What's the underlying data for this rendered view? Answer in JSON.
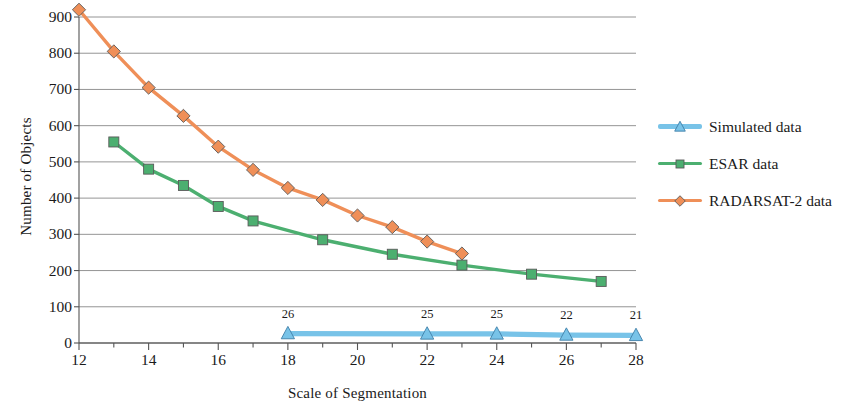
{
  "chart_data": {
    "type": "line",
    "title": "",
    "xlabel": "Scale of Segmentation",
    "ylabel": "Number of Objects",
    "xlim": [
      12,
      28
    ],
    "ylim": [
      0,
      900
    ],
    "xticks": [
      12,
      14,
      16,
      18,
      20,
      22,
      24,
      26,
      28
    ],
    "yticks": [
      0,
      100,
      200,
      300,
      400,
      500,
      600,
      700,
      800,
      900
    ],
    "minor_xtick_step": 1,
    "grid": "horizontal",
    "legend_position": "right",
    "series": [
      {
        "name": "Simulated data",
        "color": "#78C3E8",
        "marker": "triangle",
        "x": [
          18,
          22,
          24,
          26,
          28
        ],
        "values": [
          26,
          25,
          25,
          22,
          21
        ],
        "point_labels": [
          "26",
          "25",
          "25",
          "22",
          "21"
        ]
      },
      {
        "name": "ESAR data",
        "color": "#4CAF70",
        "marker": "square",
        "x": [
          13,
          14,
          15,
          16,
          17,
          19,
          21,
          23,
          25,
          27
        ],
        "values": [
          555,
          480,
          435,
          377,
          337,
          285,
          245,
          215,
          190,
          170
        ],
        "point_labels": []
      },
      {
        "name": "RADARSAT-2 data",
        "color": "#EF8F58",
        "marker": "diamond",
        "x": [
          12,
          13,
          14,
          15,
          16,
          17,
          18,
          19,
          20,
          21,
          22,
          23,
          24,
          25
        ],
        "values": [
          920,
          805,
          705,
          627,
          542,
          478,
          428,
          395,
          352,
          320,
          280,
          247,
          0,
          0
        ],
        "point_labels": []
      }
    ]
  },
  "axis": {
    "y_title": "Number of Objects",
    "x_title": "Scale of Segmentation",
    "y_labels": [
      "900",
      "800",
      "700",
      "600",
      "500",
      "400",
      "300",
      "200",
      "100",
      "0"
    ],
    "x_labels": [
      "12",
      "14",
      "16",
      "18",
      "20",
      "22",
      "24",
      "26",
      "28"
    ]
  },
  "legend": {
    "entries": [
      {
        "label": "Simulated data",
        "color": "#78C3E8",
        "marker": "triangle-icon"
      },
      {
        "label": "ESAR data",
        "color": "#4CAF70",
        "marker": "square-icon"
      },
      {
        "label": "RADARSAT-2 data",
        "color": "#EF8F58",
        "marker": "diamond-icon"
      }
    ]
  },
  "colors": {
    "simulated": "#78C3E8",
    "esar": "#4CAF70",
    "radarsat": "#EF8F58",
    "grid": "#6b6b6b",
    "axis": "#555555",
    "text": "#1a1a1a"
  }
}
